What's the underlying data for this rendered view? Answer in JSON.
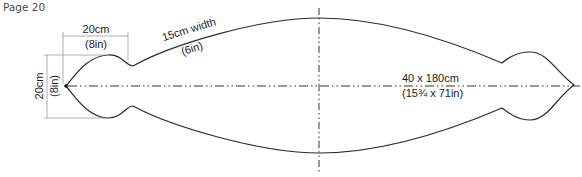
{
  "page": {
    "label": "Page 20"
  },
  "diagram": {
    "type": "pattern-template",
    "labels": {
      "lobe_width_cm": "20cm",
      "lobe_width_in": "(8in)",
      "lobe_height_cm": "20cm",
      "lobe_height_in": "(8in)",
      "band_width_cm": "15cm width",
      "band_width_in": "(6in)",
      "overall_cm": "40 x 180cm",
      "overall_in": "(15¾ x 71in)"
    },
    "colors": {
      "outline": "#2a2a2a",
      "dimension": "#9a9a9a",
      "text": "#1a1a1a"
    }
  }
}
